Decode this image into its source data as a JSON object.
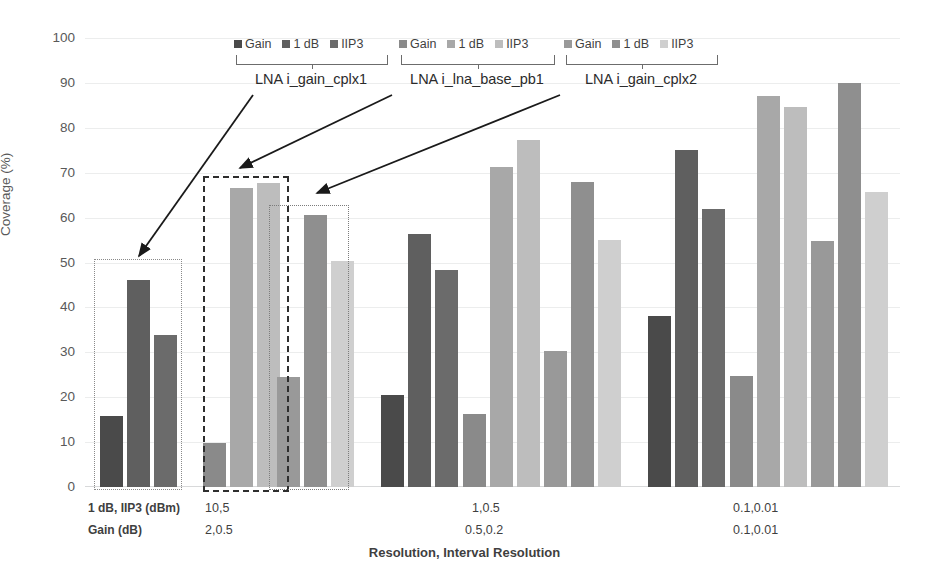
{
  "chart_data": {
    "type": "bar",
    "title": "",
    "xlabel": "Resolution, Interval Resolution",
    "ylabel": "Coverage (%)",
    "ylim": [
      0,
      100
    ],
    "yticks": [
      0,
      10,
      20,
      30,
      40,
      50,
      60,
      70,
      80,
      90,
      100
    ],
    "grid": true,
    "legend_position": "top",
    "categories": [
      "10,5 / 2,0.5",
      "1,0.5 / 0.5,0.2",
      "0.1,0.01 / 0.1,0.01"
    ],
    "legend_groups": [
      {
        "caption": "LNA i_gain_cplx1",
        "series": [
          {
            "name": "Gain",
            "color": "#4a4a4a"
          },
          {
            "name": "1 dB",
            "color": "#5f5f5f"
          },
          {
            "name": "IIP3",
            "color": "#6b6b6b"
          }
        ]
      },
      {
        "caption": "LNA i_lna_base_pb1",
        "series": [
          {
            "name": "Gain",
            "color": "#8a8a8a"
          },
          {
            "name": "1 dB",
            "color": "#a8a8a8"
          },
          {
            "name": "IIP3",
            "color": "#bdbdbd"
          }
        ]
      },
      {
        "caption": "LNA i_gain_cplx2",
        "series": [
          {
            "name": "Gain",
            "color": "#999999"
          },
          {
            "name": "1 dB",
            "color": "#8f8f8f"
          },
          {
            "name": "IIP3",
            "color": "#cfcfcf"
          }
        ]
      }
    ],
    "series": [
      {
        "name": "LNA i_gain_cplx1 Gain",
        "color": "#4a4a4a",
        "values": [
          15.8,
          20.6,
          38.0
        ]
      },
      {
        "name": "LNA i_gain_cplx1 1 dB",
        "color": "#5f5f5f",
        "values": [
          46.0,
          56.3,
          75.0
        ]
      },
      {
        "name": "LNA i_gain_cplx1 IIP3",
        "color": "#6b6b6b",
        "values": [
          33.8,
          48.3,
          62.0
        ]
      },
      {
        "name": "LNA i_lna_base_pb1 Gain",
        "color": "#8a8a8a",
        "values": [
          9.7,
          16.3,
          24.8
        ]
      },
      {
        "name": "LNA i_lna_base_pb1 1 dB",
        "color": "#a8a8a8",
        "values": [
          66.6,
          71.3,
          87.0
        ]
      },
      {
        "name": "LNA i_lna_base_pb1 IIP3",
        "color": "#bdbdbd",
        "values": [
          67.6,
          77.2,
          84.6
        ]
      },
      {
        "name": "LNA i_gain_cplx2 Gain",
        "color": "#999999",
        "values": [
          24.4,
          30.4,
          54.8
        ]
      },
      {
        "name": "LNA i_gain_cplx2 1 dB",
        "color": "#8f8f8f",
        "values": [
          60.6,
          68.0,
          90.0
        ]
      },
      {
        "name": "LNA i_gain_cplx2 IIP3",
        "color": "#cfcfcf",
        "values": [
          50.3,
          55.0,
          65.7
        ]
      }
    ],
    "annotations": {
      "row_label_1": "1 dB, IIP3 (dBm)",
      "row_label_2": "Gain (dB)",
      "group1_row1": "10,5",
      "group1_row2": "2,0.5",
      "group2_row1": "1,0.5",
      "group2_row2": "0.5,0.2",
      "group3_row1": "0.1,0.01",
      "group3_row2": "0.1,0.01"
    },
    "highlight_boxes": [
      {
        "name": "box-gain-cplx1",
        "style": "dotted"
      },
      {
        "name": "box-lna-base-pb1",
        "style": "dashed"
      },
      {
        "name": "box-gain-cplx2",
        "style": "dash-dot"
      }
    ]
  }
}
